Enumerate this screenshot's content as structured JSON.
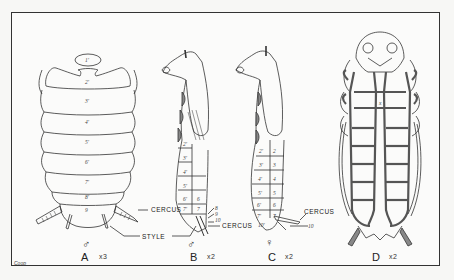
{
  "plate": {
    "signature": "Coop"
  },
  "figures": [
    {
      "id": "A",
      "letter": "A",
      "scale": "x3",
      "sex_symbol": "♂",
      "view": "dorsal",
      "segments": [
        "1'",
        "2'",
        "3'",
        "4'",
        "5'",
        "6'",
        "7'",
        "8'",
        "9"
      ],
      "callouts": [
        "CERCUS",
        "STYLE"
      ]
    },
    {
      "id": "B",
      "letter": "B",
      "scale": "x2",
      "sex_symbol": "♂",
      "view": "lateral",
      "segments_left": [
        "2'",
        "3'",
        "4'",
        "5'",
        "6'",
        "7'",
        "8'"
      ],
      "segments_right": [
        "6",
        "7",
        "8",
        "9",
        "10"
      ],
      "callouts": [
        "CERCUS"
      ]
    },
    {
      "id": "C",
      "letter": "C",
      "scale": "x2",
      "sex_symbol": "♀",
      "view": "lateral",
      "segments_left": [
        "2'",
        "3'",
        "4'",
        "5'",
        "6'",
        "7'",
        "10'"
      ],
      "segments_right": [
        "2",
        "3",
        "4",
        "5",
        "6",
        "7"
      ],
      "callouts": [
        "CERCUS",
        "10"
      ]
    },
    {
      "id": "D",
      "letter": "D",
      "scale": "x2",
      "view": "ventral"
    }
  ],
  "labels": {
    "cercus": "CERCUS",
    "style": "STYLE"
  },
  "colors": {
    "ink": "#333333",
    "paper": "#fbfbfa",
    "shade": "#8a8a8a"
  }
}
